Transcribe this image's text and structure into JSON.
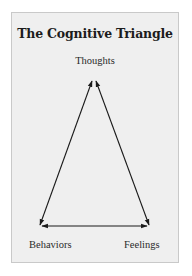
{
  "diagram": {
    "title": "The Cognitive Triangle",
    "nodes": [
      {
        "id": "thoughts",
        "label": "Thoughts"
      },
      {
        "id": "behaviors",
        "label": "Behaviors"
      },
      {
        "id": "feelings",
        "label": "Feelings"
      }
    ],
    "edges": [
      {
        "from": "thoughts",
        "to": "behaviors",
        "type": "bidirectional-arrow"
      },
      {
        "from": "thoughts",
        "to": "feelings",
        "type": "bidirectional-arrow"
      },
      {
        "from": "behaviors",
        "to": "feelings",
        "type": "bidirectional-arrow"
      }
    ],
    "colors": {
      "card_background": "#efefef",
      "card_border": "#c9c9c9",
      "text": "#1c1c1c",
      "arrow": "#1a1a1a"
    }
  }
}
